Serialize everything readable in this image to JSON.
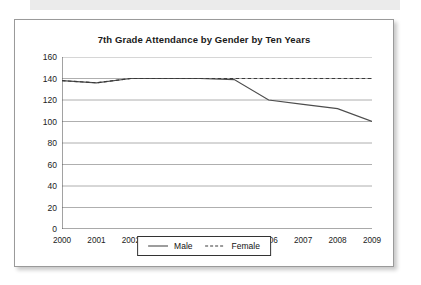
{
  "card": {
    "title": "7th Grade Attendance by Gender by Ten Years"
  },
  "chart_data": {
    "type": "line",
    "title": "7th Grade Attendance by Gender by Ten Years",
    "xlabel": "",
    "ylabel": "",
    "categories": [
      "2000",
      "2001",
      "2002",
      "2003",
      "2004",
      "2005",
      "2006",
      "2007",
      "2008",
      "2009"
    ],
    "x": [
      2000,
      2001,
      2002,
      2003,
      2004,
      2005,
      2006,
      2007,
      2008,
      2009
    ],
    "series": [
      {
        "name": "Male",
        "style": "solid",
        "color": "#4d4d4d",
        "values": [
          138,
          136,
          140,
          140,
          140,
          139,
          120,
          116,
          112,
          100
        ]
      },
      {
        "name": "Female",
        "style": "dashed",
        "color": "#3a3a3a",
        "values": [
          138,
          136,
          140,
          140,
          140,
          140,
          140,
          140,
          140,
          140
        ]
      }
    ],
    "ylim": [
      0,
      160
    ],
    "yticks": [
      0,
      20,
      40,
      60,
      80,
      100,
      120,
      140,
      160
    ],
    "ytick_labels": [
      "0",
      "20",
      "40",
      "60",
      "80",
      "100",
      "120",
      "140",
      "160"
    ],
    "xlim": [
      2000,
      2009
    ],
    "grid": "horizontal",
    "legend_position": "bottom-center",
    "legend": [
      "Male",
      "Female"
    ]
  },
  "legend": {
    "male_label": "Male",
    "female_label": "Female"
  },
  "colors": {
    "grid": "#9b9b9b",
    "axis": "#555555",
    "male_line": "#4d4d4d",
    "female_line": "#3a3a3a",
    "card_border": "#9a9a9a",
    "scan_band": "#ebebeb"
  }
}
